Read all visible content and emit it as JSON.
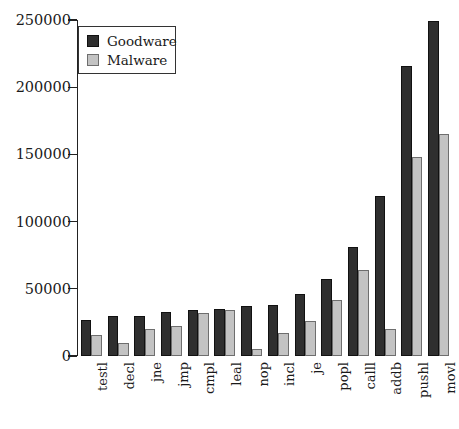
{
  "chart_data": {
    "type": "bar",
    "title": "",
    "xlabel": "",
    "ylabel": "",
    "grid": false,
    "legend_position": "top-left",
    "ylim": [
      0,
      250000
    ],
    "yticks": [
      0,
      50000,
      100000,
      150000,
      200000,
      250000
    ],
    "ytick_labels": [
      "0",
      "50000",
      "100000",
      "150000",
      "200000",
      "250000"
    ],
    "categories": [
      "testl",
      "decl",
      "jne",
      "jmp",
      "cmpl",
      "leal",
      "nop",
      "incl",
      "je",
      "popl",
      "calll",
      "addb",
      "pushl",
      "movl"
    ],
    "series": [
      {
        "name": "Goodware",
        "color": "#2f2f2f",
        "values": [
          27000,
          30000,
          30000,
          33000,
          34000,
          35000,
          37000,
          38000,
          46000,
          57000,
          81000,
          119000,
          216000,
          249000
        ]
      },
      {
        "name": "Malware",
        "color": "#c3c3c3",
        "values": [
          16000,
          10000,
          20000,
          22000,
          32000,
          34000,
          5000,
          17000,
          26000,
          42000,
          64000,
          20000,
          148000,
          165000
        ]
      }
    ]
  },
  "legend": {
    "items": [
      {
        "label": "Goodware",
        "swatch": "dark-square-swatch"
      },
      {
        "label": "Malware",
        "swatch": "light-square-swatch"
      }
    ]
  }
}
